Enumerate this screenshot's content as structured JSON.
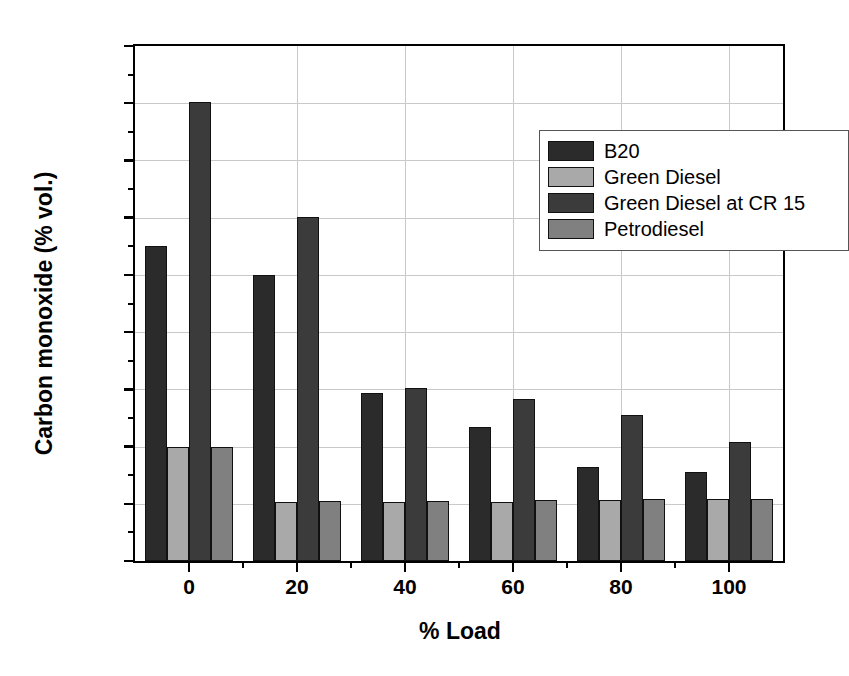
{
  "chart_data": {
    "type": "bar",
    "title": "",
    "xlabel": "% Load",
    "ylabel": "Carbon monoxide (% vol.)",
    "categories": [
      "0",
      "20",
      "40",
      "60",
      "80",
      "100"
    ],
    "ylim": [
      0.0,
      0.09
    ],
    "ytick_step": 0.01,
    "yminor_step": 0.005,
    "grid": true,
    "legend_position": "top-right-inside",
    "ytick_labels": [
      "0.00",
      "0.01",
      "0.02",
      "0.03",
      "0.04",
      "0.05",
      "0.06",
      "0.07",
      "0.08",
      "0.09"
    ],
    "xtick_labels": [
      "0",
      "20",
      "40",
      "60",
      "80",
      "100"
    ],
    "series": [
      {
        "name": "B20",
        "color": "#2b2b2b",
        "values": [
          0.055,
          0.05,
          0.0293,
          0.0234,
          0.0165,
          0.0155
        ]
      },
      {
        "name": "Green Diesel",
        "color": "#a9a9a9",
        "values": [
          0.02,
          0.0103,
          0.0104,
          0.0104,
          0.0107,
          0.0108
        ]
      },
      {
        "name": "Green Diesel at CR 15",
        "color": "#3b3b3b",
        "values": [
          0.0802,
          0.0602,
          0.0303,
          0.0284,
          0.0255,
          0.0208
        ]
      },
      {
        "name": "Petrodiesel",
        "color": "#808080",
        "values": [
          0.02,
          0.0105,
          0.0105,
          0.0106,
          0.0108,
          0.0109
        ]
      }
    ]
  },
  "legend": {
    "items": [
      {
        "label": "B20",
        "color": "#2b2b2b"
      },
      {
        "label": "Green Diesel",
        "color": "#a9a9a9"
      },
      {
        "label": "Green Diesel at CR 15",
        "color": "#3b3b3b"
      },
      {
        "label": "Petrodiesel",
        "color": "#808080"
      }
    ]
  },
  "axes": {
    "y_title": "Carbon monoxide (% vol.)",
    "x_title": "% Load"
  }
}
